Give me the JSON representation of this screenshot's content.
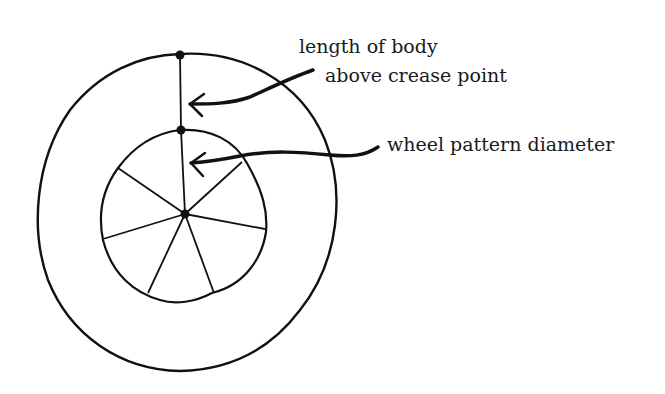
{
  "diagram": {
    "labels": {
      "length_of_body_line1": "length of body",
      "length_of_body_line2": "above crease point",
      "wheel_pattern_diameter": "wheel pattern diameter"
    },
    "elements": {
      "outer_circle": "outer circle",
      "inner_circle": "inner circle (wheel pattern)",
      "spokes": 7,
      "points": [
        "top point on outer circle",
        "top point on inner circle",
        "center point"
      ]
    },
    "colors": {
      "stroke": "#111111",
      "background": "#ffffff"
    }
  }
}
